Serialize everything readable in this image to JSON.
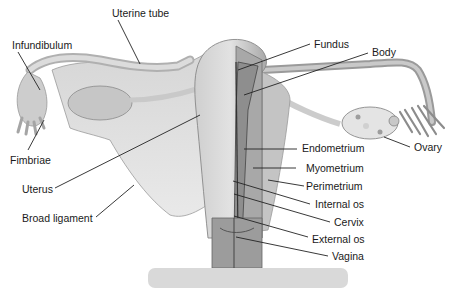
{
  "diagram": {
    "colors": {
      "tissue_light": "#d4d4d4",
      "tissue_mid": "#b8b8b8",
      "tissue_dark": "#8f8f8f",
      "line": "#222222",
      "bar": "#d9d9d9"
    },
    "labels": [
      {
        "id": "uterine-tube",
        "text": "Uterine tube",
        "x": 112,
        "y": 7,
        "line": [
          118,
          20,
          140,
          64
        ]
      },
      {
        "id": "infundibulum",
        "text": "Infundibulum",
        "x": 12,
        "y": 39,
        "line": [
          18,
          52,
          40,
          90
        ]
      },
      {
        "id": "fundus",
        "text": "Fundus",
        "x": 314,
        "y": 38,
        "line": [
          310,
          44,
          238,
          70
        ]
      },
      {
        "id": "body",
        "text": "Body",
        "x": 372,
        "y": 46,
        "line": [
          368,
          53,
          244,
          95
        ]
      },
      {
        "id": "fimbriae",
        "text": "Fimbriae",
        "x": 10,
        "y": 154,
        "line": [
          28,
          150,
          44,
          120
        ]
      },
      {
        "id": "ovary",
        "text": "Ovary",
        "x": 414,
        "y": 141,
        "line": [
          410,
          147,
          384,
          137
        ]
      },
      {
        "id": "endometrium",
        "text": "Endometrium",
        "x": 302,
        "y": 142,
        "line": [
          297,
          149,
          244,
          149
        ]
      },
      {
        "id": "uterus",
        "text": "Uterus",
        "x": 22,
        "y": 183,
        "line": [
          55,
          188,
          200,
          115
        ]
      },
      {
        "id": "myometrium",
        "text": "Myometrium",
        "x": 306,
        "y": 162,
        "line": [
          296,
          168,
          253,
          168
        ]
      },
      {
        "id": "perimetrium",
        "text": "Perimetrium",
        "x": 306,
        "y": 180,
        "line": [
          304,
          186,
          268,
          180
        ]
      },
      {
        "id": "broad-ligament",
        "text": "Broad ligament",
        "x": 22,
        "y": 212,
        "line": [
          96,
          217,
          134,
          185
        ]
      },
      {
        "id": "internal-os",
        "text": "Internal os",
        "x": 315,
        "y": 198,
        "line": [
          310,
          204,
          233,
          181
        ]
      },
      {
        "id": "cervix",
        "text": "Cervix",
        "x": 334,
        "y": 216,
        "line": [
          330,
          222,
          234,
          194
        ]
      },
      {
        "id": "external-os",
        "text": "External os",
        "x": 312,
        "y": 233,
        "line": [
          308,
          237,
          234,
          216
        ]
      },
      {
        "id": "vagina",
        "text": "Vagina",
        "x": 332,
        "y": 250,
        "line": [
          328,
          256,
          236,
          237
        ]
      }
    ]
  }
}
